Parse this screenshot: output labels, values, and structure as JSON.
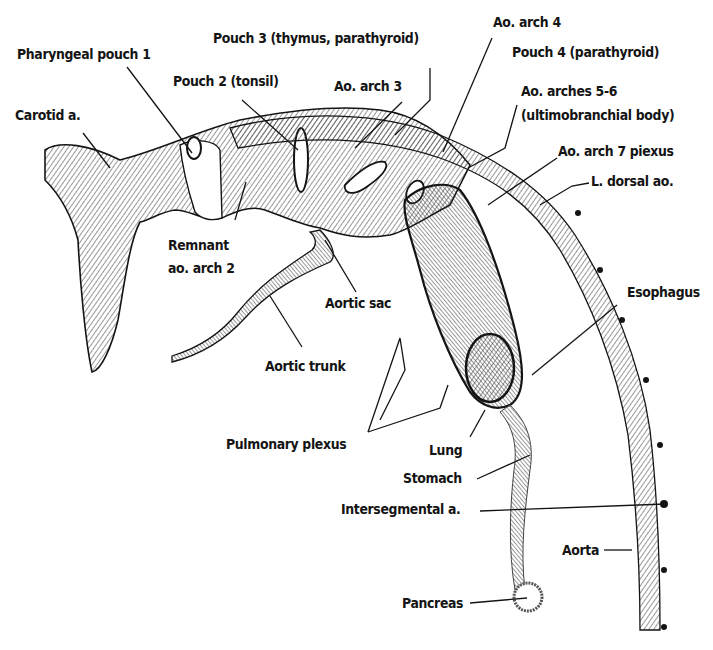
{
  "figure": {
    "colors": {
      "ink": "#141414",
      "paper": "#ffffff",
      "hatch": "#555555"
    }
  },
  "labels": {
    "pharyngeal_pouch_1": "Pharyngeal pouch 1",
    "carotid_a": "Carotid a.",
    "pouch_2": "Pouch 2 (tonsil)",
    "pouch_3": "Pouch 3 (thymus, parathyroid)",
    "ao_arch_3": "Ao. arch 3",
    "ao_arch_4": "Ao. arch 4",
    "pouch_4": "Pouch 4 (parathyroid)",
    "ao_arches_5_6_line1": "Ao. arches 5-6",
    "ao_arches_5_6_line2": "(ultimobranchial body)",
    "ao_arch_7_plexus": "Ao. arch 7 piexus",
    "l_dorsal_ao": "L. dorsal ao.",
    "remnant_line1": "Remnant",
    "remnant_line2": "ao. arch 2",
    "aortic_sac": "Aortic sac",
    "aortic_trunk": "Aortic trunk",
    "esophagus": "Esophagus",
    "pulmonary_plexus": "Pulmonary plexus",
    "lung": "Lung",
    "stomach": "Stomach",
    "intersegmental_a": "Intersegmental a.",
    "aorta": "Aorta",
    "pancreas": "Pancreas"
  }
}
